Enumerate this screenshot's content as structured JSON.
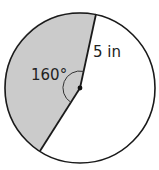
{
  "diagram": {
    "type": "circle-sector",
    "angle_label": "160°",
    "radius_label": "5 in",
    "shaded_color": "#cbcbcb",
    "stroke_color": "#1a1a1a"
  }
}
